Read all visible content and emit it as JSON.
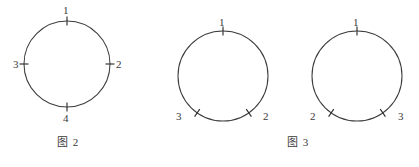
{
  "page": {
    "width": 419,
    "height": 167,
    "background_color": "#ffffff",
    "line_color": "#3c3c3c",
    "text_color": "#3a3a3a"
  },
  "figures": [
    {
      "id": "figure-2",
      "caption": "图 2",
      "caption_x": 57,
      "caption_y": 136,
      "circles": [
        {
          "id": "circle-a",
          "cx": 67,
          "cy": 64,
          "r": 43,
          "marks": [
            {
              "label": "1",
              "angle_deg": 90,
              "label_x": 63,
              "label_y": 5
            },
            {
              "label": "2",
              "angle_deg": 0,
              "label_x": 116,
              "label_y": 59
            },
            {
              "label": "3",
              "angle_deg": 180,
              "label_x": 13,
              "label_y": 59
            },
            {
              "label": "4",
              "angle_deg": 270,
              "label_x": 63,
              "label_y": 113
            }
          ]
        }
      ]
    },
    {
      "id": "figure-3",
      "caption": "图 3",
      "caption_x": 287,
      "caption_y": 136,
      "circles": [
        {
          "id": "circle-b",
          "cx": 223,
          "cy": 76,
          "r": 45,
          "marks": [
            {
              "label": "1",
              "angle_deg": 90,
              "label_x": 219,
              "label_y": 17
            },
            {
              "label": "2",
              "angle_deg": 305,
              "label_x": 263,
              "label_y": 111
            },
            {
              "label": "3",
              "angle_deg": 235,
              "label_x": 176,
              "label_y": 111
            }
          ]
        },
        {
          "id": "circle-c",
          "cx": 357,
          "cy": 76,
          "r": 45,
          "marks": [
            {
              "label": "1",
              "angle_deg": 90,
              "label_x": 353,
              "label_y": 17
            },
            {
              "label": "2",
              "angle_deg": 235,
              "label_x": 310,
              "label_y": 111
            },
            {
              "label": "3",
              "angle_deg": 305,
              "label_x": 398,
              "label_y": 111
            }
          ]
        }
      ]
    }
  ]
}
